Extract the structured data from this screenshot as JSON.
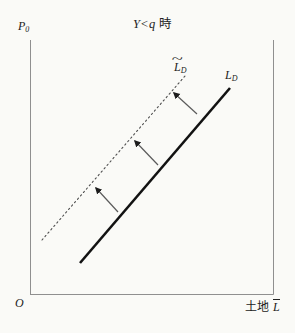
{
  "figure": {
    "title": {
      "lhs": "Y",
      "op": "<",
      "rhs": "q",
      "suffix": "時"
    },
    "axes": {
      "y_label": {
        "base": "P",
        "sub": "0"
      },
      "origin": "O",
      "x_label": {
        "text": "土地",
        "bar_letter": "L"
      }
    },
    "curves": [
      {
        "id": "shifted-demand",
        "style": "dotted",
        "color": "#4f4f4f",
        "label": {
          "accent": "~",
          "base": "L",
          "sub": "D"
        },
        "x1": 42,
        "y1": 240,
        "x2": 185,
        "y2": 76
      },
      {
        "id": "demand",
        "style": "solid",
        "color": "#121212",
        "label": {
          "base": "L",
          "sub": "D"
        },
        "x1": 80,
        "y1": 263,
        "x2": 230,
        "y2": 88
      }
    ],
    "arrows": [
      {
        "x1": 118,
        "y1": 212,
        "x2": 96,
        "y2": 188
      },
      {
        "x1": 158,
        "y1": 165,
        "x2": 135,
        "y2": 141
      },
      {
        "x1": 197,
        "y1": 114,
        "x2": 174,
        "y2": 93
      }
    ],
    "colors": {
      "background": "#fafaf7",
      "axis": "#8f8f8f",
      "arrow": "#5a5a5a",
      "text": "#222222"
    }
  }
}
